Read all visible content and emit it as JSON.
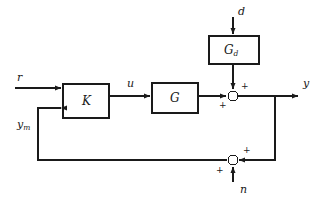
{
  "diagram": {
    "stroke_color": "#1a1a1a",
    "background": "#ffffff",
    "blocks": [
      {
        "id": "K",
        "label": "K",
        "sublabel": "",
        "x": 63,
        "y": 84,
        "w": 46,
        "h": 34
      },
      {
        "id": "G",
        "label": "G",
        "sublabel": "",
        "x": 152,
        "y": 83,
        "w": 46,
        "h": 30
      },
      {
        "id": "Gd",
        "label": "G",
        "sublabel": "d",
        "x": 209,
        "y": 36,
        "w": 50,
        "h": 28
      }
    ],
    "junctions": [
      {
        "id": "sum-output",
        "cx": 233,
        "cy": 96,
        "r": 5,
        "signs": [
          {
            "text": "+",
            "x": 241,
            "y": 82
          },
          {
            "text": "+",
            "x": 219,
            "y": 101
          }
        ]
      },
      {
        "id": "sum-feedback",
        "cx": 233,
        "cy": 160,
        "r": 5,
        "signs": [
          {
            "text": "+",
            "x": 243,
            "y": 146
          },
          {
            "text": "+",
            "x": 216,
            "y": 166
          }
        ]
      }
    ],
    "signals": [
      {
        "id": "reference",
        "label": "r",
        "sub": "",
        "x": 17,
        "y": 72
      },
      {
        "id": "control",
        "label": "u",
        "sub": "",
        "x": 127,
        "y": 78
      },
      {
        "id": "disturbance",
        "label": "d",
        "sub": "",
        "x": 238,
        "y": 6
      },
      {
        "id": "output",
        "label": "y",
        "sub": "",
        "x": 303,
        "y": 78
      },
      {
        "id": "measured",
        "label": "y",
        "sub": "m",
        "x": 17,
        "y": 119
      },
      {
        "id": "noise",
        "label": "n",
        "sub": "",
        "x": 240,
        "y": 184
      }
    ]
  }
}
